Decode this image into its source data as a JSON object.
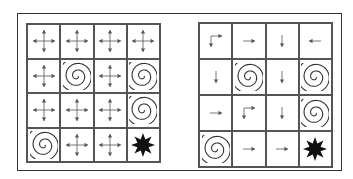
{
  "figure": {
    "colors": {
      "line": "#555555",
      "arrow": "#555555",
      "spiral": "#333333",
      "goal": "#111111",
      "background": "#ffffff"
    }
  },
  "left_grid": {
    "name": "all-actions",
    "rows": [
      [
        "all",
        "all",
        "all",
        "all"
      ],
      [
        "all",
        "hole",
        "all",
        "hole"
      ],
      [
        "all",
        "all",
        "all",
        "hole"
      ],
      [
        "hole",
        "all",
        "all",
        "goal"
      ]
    ]
  },
  "right_grid": {
    "name": "policy",
    "rows": [
      [
        "right-down",
        "right",
        "down",
        "left"
      ],
      [
        "down",
        "hole",
        "down",
        "hole"
      ],
      [
        "right",
        "right-down",
        "down",
        "hole"
      ],
      [
        "hole",
        "right",
        "right",
        "goal"
      ]
    ]
  },
  "legend": {
    "all": "four-way-arrow-icon",
    "hole": "spiral-icon",
    "goal": "star-icon",
    "right": "arrow-right-icon",
    "left": "arrow-left-icon",
    "down": "arrow-down-icon",
    "right-down": "arrow-right-down-icon"
  }
}
